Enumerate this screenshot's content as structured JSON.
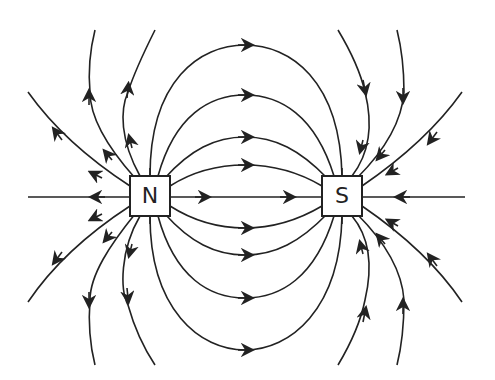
{
  "diagram": {
    "poles": [
      {
        "label": "N",
        "name": "north-pole",
        "x": 130,
        "y": 176,
        "w": 40,
        "h": 40
      },
      {
        "label": "S",
        "name": "south-pole",
        "x": 322,
        "y": 176,
        "w": 40,
        "h": 40
      }
    ],
    "colors": {
      "line": "#222222",
      "background": "#ffffff"
    },
    "field_line_direction": "from N outward, into S"
  }
}
